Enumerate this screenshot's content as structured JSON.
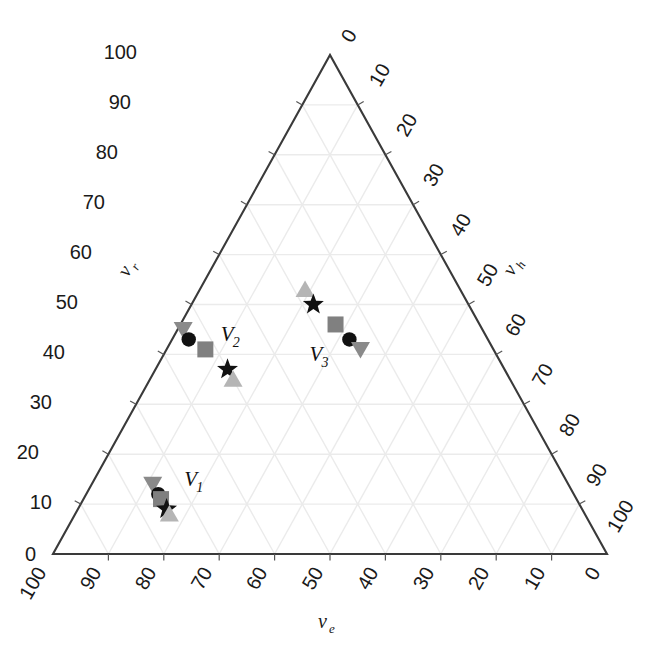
{
  "chart_data": {
    "type": "scatter",
    "subtype": "ternary",
    "title": "",
    "axes": {
      "left": {
        "name": "nu_r",
        "label_text": "ν",
        "label_sub": "r",
        "ticks": [
          0,
          10,
          20,
          30,
          40,
          50,
          60,
          70,
          80,
          90,
          100
        ],
        "direction": "bottom-to-top"
      },
      "right": {
        "name": "nu_h",
        "label_text": "ν",
        "label_sub": "h",
        "ticks": [
          0,
          10,
          20,
          30,
          40,
          50,
          60,
          70,
          80,
          90,
          100
        ],
        "direction": "top-to-bottom"
      },
      "bottom": {
        "name": "nu_e",
        "label_text": "ν",
        "label_sub": "e",
        "ticks": [
          100,
          90,
          80,
          70,
          60,
          50,
          40,
          30,
          20,
          10,
          0
        ],
        "direction": "left-to-right-descending"
      }
    },
    "grid": true,
    "grid_interval": 10,
    "legend": "none",
    "annotations": [
      {
        "id": "V1",
        "text": "V",
        "sub": "1"
      },
      {
        "id": "V2",
        "text": "V",
        "sub": "2"
      },
      {
        "id": "V3",
        "text": "V",
        "sub": "3"
      }
    ],
    "clusters": [
      {
        "id": "V1",
        "label_text": "V",
        "label_sub": "1",
        "points": [
          {
            "marker": "triangle-down",
            "color": "#8a8a8a",
            "nu_e": 75,
            "nu_r": 14,
            "nu_h": 11
          },
          {
            "marker": "circle",
            "color": "#111111",
            "nu_e": 75,
            "nu_r": 12,
            "nu_h": 13
          },
          {
            "marker": "square",
            "color": "#808080",
            "nu_e": 75,
            "nu_r": 11,
            "nu_h": 14
          },
          {
            "marker": "star",
            "color": "#111111",
            "nu_e": 75,
            "nu_r": 9,
            "nu_h": 16
          },
          {
            "marker": "triangle-up",
            "color": "#b5b5b5",
            "nu_e": 75,
            "nu_r": 8,
            "nu_h": 17
          }
        ]
      },
      {
        "id": "V2",
        "label_text": "V",
        "label_sub": "2",
        "points": [
          {
            "marker": "triangle-down",
            "color": "#8a8a8a",
            "nu_e": 54,
            "nu_r": 45,
            "nu_h": 1
          },
          {
            "marker": "circle",
            "color": "#111111",
            "nu_e": 54,
            "nu_r": 43,
            "nu_h": 3
          },
          {
            "marker": "square",
            "color": "#808080",
            "nu_e": 52,
            "nu_r": 41,
            "nu_h": 7
          },
          {
            "marker": "star",
            "color": "#111111",
            "nu_e": 50,
            "nu_r": 37,
            "nu_h": 13
          },
          {
            "marker": "triangle-up",
            "color": "#b5b5b5",
            "nu_e": 50,
            "nu_r": 35,
            "nu_h": 15
          }
        ]
      },
      {
        "id": "V3",
        "label_text": "V",
        "label_sub": "3",
        "points": [
          {
            "marker": "triangle-up",
            "color": "#b5b5b5",
            "nu_e": 28,
            "nu_r": 53,
            "nu_h": 19
          },
          {
            "marker": "star",
            "color": "#111111",
            "nu_e": 28,
            "nu_r": 50,
            "nu_h": 22
          },
          {
            "marker": "square",
            "color": "#808080",
            "nu_e": 26,
            "nu_r": 46,
            "nu_h": 28
          },
          {
            "marker": "circle",
            "color": "#111111",
            "nu_e": 25,
            "nu_r": 43,
            "nu_h": 32
          },
          {
            "marker": "triangle-down",
            "color": "#8a8a8a",
            "nu_e": 24,
            "nu_r": 41,
            "nu_h": 35
          }
        ]
      }
    ],
    "colors": {
      "axis_line": "#3a3a3a",
      "grid_line": "#ebebeb",
      "text": "#1a1a1a",
      "marker_black": "#111111",
      "marker_dark_gray": "#8a8a8a",
      "marker_mid_gray": "#808080",
      "marker_light_gray": "#b5b5b5"
    }
  },
  "left_ticks": [
    {
      "v": "0",
      "x": 36,
      "y": 561
    },
    {
      "v": "10",
      "x": 52,
      "y": 509
    },
    {
      "v": "20",
      "x": 39,
      "y": 459
    },
    {
      "v": "30",
      "x": 52,
      "y": 409
    },
    {
      "v": "40",
      "x": 65,
      "y": 359
    },
    {
      "v": "50",
      "x": 78,
      "y": 309
    },
    {
      "v": "60",
      "x": 92,
      "y": 259
    },
    {
      "v": "70",
      "x": 105,
      "y": 209
    },
    {
      "v": "80",
      "x": 118,
      "y": 159
    },
    {
      "v": "90",
      "x": 131,
      "y": 109
    },
    {
      "v": "100",
      "x": 137,
      "y": 59
    }
  ],
  "right_ticks": [
    {
      "v": "0",
      "x": 352,
      "y": 44
    },
    {
      "v": "10",
      "x": 380,
      "y": 88
    },
    {
      "v": "20",
      "x": 407,
      "y": 138
    },
    {
      "v": "30",
      "x": 434,
      "y": 188
    },
    {
      "v": "40",
      "x": 461,
      "y": 238
    },
    {
      "v": "50",
      "x": 488,
      "y": 288
    },
    {
      "v": "60",
      "x": 516,
      "y": 338
    },
    {
      "v": "70",
      "x": 543,
      "y": 388
    },
    {
      "v": "80",
      "x": 570,
      "y": 438
    },
    {
      "v": "90",
      "x": 597,
      "y": 488
    },
    {
      "v": "100",
      "x": 618,
      "y": 534
    }
  ],
  "bottom_ticks": [
    {
      "v": "100",
      "x": 47
    },
    {
      "v": "90",
      "x": 102
    },
    {
      "v": "80",
      "x": 157
    },
    {
      "v": "70",
      "x": 213
    },
    {
      "v": "60",
      "x": 268
    },
    {
      "v": "50",
      "x": 324
    },
    {
      "v": "40",
      "x": 379
    },
    {
      "v": "30",
      "x": 435
    },
    {
      "v": "20",
      "x": 490
    },
    {
      "v": "10",
      "x": 546
    },
    {
      "v": "0",
      "x": 601
    }
  ]
}
